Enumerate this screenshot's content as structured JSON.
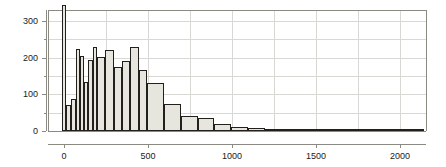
{
  "chart_data": {
    "type": "bar",
    "title": "",
    "subtitle": "",
    "xlabel": "",
    "ylabel": "",
    "grid": true,
    "legend": null,
    "xlim": [
      -95,
      2155
    ],
    "ylim": [
      0,
      330
    ],
    "xticks": [
      0,
      500,
      1000,
      1500,
      2000
    ],
    "xticklabels": [
      "0",
      "500",
      "1000",
      "1500",
      "2000"
    ],
    "yticks": [
      0,
      100,
      200,
      300
    ],
    "yticklabels": [
      "0",
      "100",
      "200",
      "300"
    ],
    "y_minor_ticks": [
      50,
      150,
      250
    ],
    "x_minor_ticks": [
      250,
      750,
      1250,
      1750,
      2250
    ],
    "bin_edges": [
      -10,
      10,
      40,
      70,
      95,
      120,
      145,
      170,
      195,
      245,
      295,
      345,
      395,
      445,
      495,
      595,
      695,
      795,
      895,
      995,
      1095,
      1195,
      1295,
      1395,
      1545,
      1695,
      1845,
      1995,
      2145
    ],
    "values": [
      345,
      70,
      88,
      225,
      205,
      133,
      195,
      230,
      202,
      220,
      175,
      192,
      230,
      167,
      130,
      73,
      41,
      35,
      19,
      10,
      8,
      4,
      3,
      3,
      2,
      2,
      2,
      4
    ],
    "bar_fill_color": "#e6e5de",
    "bar_edge_color": "#231f1c",
    "grid_color": "#d8d8d4",
    "axis_color": "#8a8a82",
    "background_color": "#ffffff"
  },
  "axes": {
    "x_axis_name": "x-axis",
    "y_axis_name": "y-axis"
  }
}
